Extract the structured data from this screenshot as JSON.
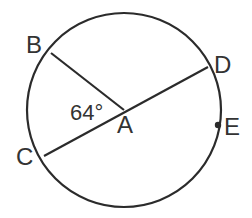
{
  "diagram": {
    "type": "circle-geometry",
    "colors": {
      "stroke": "#2b2b2b",
      "text": "#333333",
      "background": "#ffffff"
    },
    "circle": {
      "center_label": "A",
      "cx": 124,
      "cy": 110,
      "r": 97
    },
    "points": {
      "A": {
        "label": "A",
        "x": 124,
        "y": 110
      },
      "B": {
        "label": "B",
        "x": 51,
        "y": 53
      },
      "C": {
        "label": "C",
        "x": 44,
        "y": 156
      },
      "D": {
        "label": "D",
        "x": 208,
        "y": 67
      },
      "E": {
        "label": "E",
        "x": 218,
        "y": 125
      }
    },
    "segments": [
      {
        "from": "A",
        "to": "B",
        "kind": "radius"
      },
      {
        "from": "C",
        "to": "D",
        "kind": "diameter"
      }
    ],
    "angle": {
      "vertex": "A",
      "between": [
        "B",
        "C"
      ],
      "label": "64°"
    }
  }
}
